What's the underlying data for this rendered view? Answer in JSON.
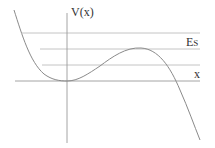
{
  "diagram": {
    "labels": {
      "y_axis": "V(x)",
      "x_axis": "x",
      "energy_main": "E",
      "energy_sub": "S"
    },
    "colors": {
      "curve": "#8a8a8a",
      "axes": "#9a9a9a",
      "levels": "#b5b5b5",
      "text": "#333333"
    },
    "energy_levels_count": 3,
    "curve_description": "Potential with local minimum at origin and local maximum at energy Es, falling off to the right"
  }
}
